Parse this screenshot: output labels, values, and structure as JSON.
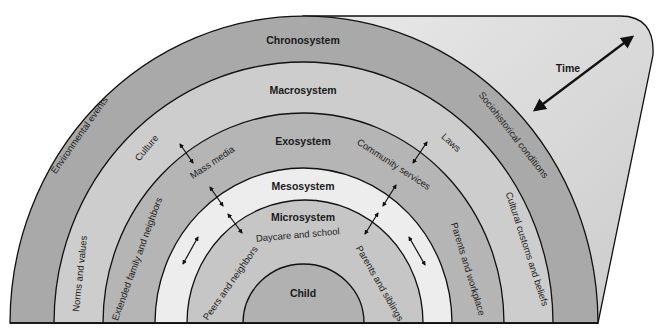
{
  "diagram": {
    "type": "ecological-systems-model",
    "systems": [
      {
        "id": "chronosystem",
        "label": "Chronosystem",
        "color": "#a9a9a9"
      },
      {
        "id": "macrosystem",
        "label": "Macrosystem",
        "color": "#cdcdcd"
      },
      {
        "id": "exosystem",
        "label": "Exosystem",
        "color": "#b5b5b5"
      },
      {
        "id": "mesosystem",
        "label": "Mesosystem",
        "color": "#ededed"
      },
      {
        "id": "microsystem",
        "label": "Microsystem",
        "color": "#c6c6c6"
      },
      {
        "id": "child",
        "label": "Child",
        "color": "#b1b1b1"
      }
    ],
    "time": {
      "label": "Time",
      "region_color_light": "#e8e8e8",
      "region_color_dark": "#cfcfcf"
    },
    "chronosystem_items": {
      "left": "Environmental events",
      "right": "Sociohistorical conditions"
    },
    "macrosystem_items": {
      "left_upper": "Culture",
      "left_lower": "Norms and values",
      "right_upper": "Laws",
      "right_lower": "Cultural customs and beliefs"
    },
    "exosystem_items": {
      "left_upper": "Mass media",
      "left_lower": "Extended family and neighbors",
      "right_upper": "Community services",
      "right_lower": "Parents and workplace"
    },
    "microsystem_items": {
      "top": "Daycare and school",
      "left": "Peers and neighbors",
      "right": "Parents and siblings"
    }
  }
}
